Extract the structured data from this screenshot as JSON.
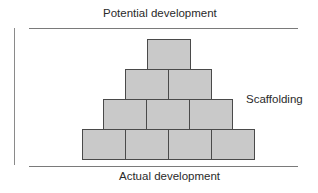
{
  "diagram": {
    "top_label": "Potential development",
    "bottom_label": "Actual development",
    "side_label": "Scaffolding",
    "rows": [
      {
        "level": 1,
        "blocks": 1
      },
      {
        "level": 2,
        "blocks": 2
      },
      {
        "level": 3,
        "blocks": 3
      },
      {
        "level": 4,
        "blocks": 4
      }
    ],
    "colors": {
      "block_fill": "#c9c9c9",
      "block_border": "#4a4a4a",
      "line": "#7a7a7a",
      "text": "#2a2a2a"
    }
  }
}
